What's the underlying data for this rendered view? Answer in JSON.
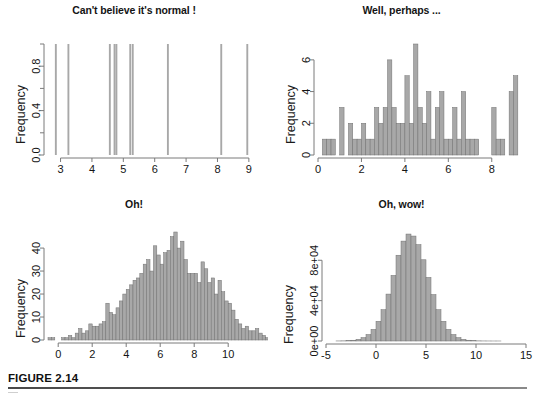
{
  "figure": {
    "caption_label": "FIGURE 2.14",
    "axis_color": "#7a7a7a",
    "bar_fill": "#a8a8a8",
    "bar_stroke": "#707070",
    "text_color": "#141414"
  },
  "panels": [
    {
      "id": "top-left",
      "title": "Can't believe it's normal !",
      "ylabel": "Frequency"
    },
    {
      "id": "top-right",
      "title": "Well, perhaps ...",
      "ylabel": "Frequency"
    },
    {
      "id": "bottom-left",
      "title": "Oh!",
      "ylabel": "Frequency"
    },
    {
      "id": "bottom-right",
      "title": "Oh, wow!",
      "ylabel": "Frequency"
    }
  ],
  "chart_data": [
    {
      "type": "bar",
      "id": "top-left",
      "title": "Can't believe it's normal !",
      "xlabel": "",
      "ylabel": "Frequency",
      "xlim": [
        2.6,
        9.1
      ],
      "ylim": [
        0,
        1
      ],
      "xticks": [
        3,
        4,
        5,
        6,
        7,
        8,
        9
      ],
      "xticklabels": [
        "3",
        "4",
        "5",
        "6",
        "7",
        "8",
        "9"
      ],
      "yticks": [
        0.0,
        0.2,
        0.4,
        0.6,
        0.8,
        1.0
      ],
      "yticklabels": [
        "0.0",
        "",
        "0.4",
        "",
        "0.8",
        ""
      ],
      "grid": false,
      "legend": null,
      "note": "Histogram of 10 observations, one unit-height bar per observation",
      "bin_width": 0.06,
      "bin_centers": [
        2.85,
        3.25,
        4.57,
        4.72,
        4.78,
        5.22,
        5.3,
        6.42,
        8.12,
        8.95
      ],
      "values": [
        1,
        1,
        1,
        1,
        1,
        1,
        1,
        1,
        1,
        1
      ]
    },
    {
      "type": "bar",
      "id": "top-right",
      "title": "Well, perhaps ...",
      "xlabel": "",
      "ylabel": "Frequency",
      "xlim": [
        0,
        9.3
      ],
      "ylim": [
        0,
        7
      ],
      "xticks": [
        0,
        2,
        4,
        6,
        8
      ],
      "xticklabels": [
        "0",
        "2",
        "4",
        "6",
        "8"
      ],
      "yticks": [
        0,
        2,
        4,
        6
      ],
      "yticklabels": [
        "0",
        "2",
        "4",
        "6"
      ],
      "grid": false,
      "legend": null,
      "note": "Histogram of 100 observations, bin width 0.2",
      "bin_width": 0.2,
      "bin_starts": [
        0.2,
        0.4,
        0.6,
        1.0,
        1.2,
        1.4,
        1.6,
        1.8,
        2.0,
        2.2,
        2.4,
        2.6,
        2.8,
        3.0,
        3.2,
        3.4,
        3.6,
        3.8,
        4.0,
        4.2,
        4.4,
        4.6,
        4.8,
        5.0,
        5.2,
        5.4,
        5.6,
        5.8,
        6.0,
        6.2,
        6.4,
        6.6,
        6.8,
        7.0,
        7.2,
        7.4,
        8.0,
        8.2,
        8.4,
        8.8,
        9.0
      ],
      "values": [
        1,
        1,
        1,
        3,
        0,
        2,
        1,
        1,
        2,
        1,
        1,
        3,
        2,
        3,
        6,
        3,
        2,
        2,
        5,
        2,
        7,
        3,
        2,
        4,
        1,
        3,
        4,
        1,
        1,
        3,
        1,
        4,
        1,
        1,
        1,
        0,
        3,
        1,
        1,
        4,
        5
      ]
    },
    {
      "type": "bar",
      "id": "bottom-left",
      "title": "Oh!",
      "xlabel": "",
      "ylabel": "Frequency",
      "xlim": [
        -0.6,
        11.4
      ],
      "ylim": [
        0,
        47
      ],
      "xticks": [
        0,
        2,
        4,
        6,
        8,
        10
      ],
      "xticklabels": [
        "0",
        "2",
        "4",
        "6",
        "8",
        "10"
      ],
      "yticks": [
        0,
        10,
        20,
        30,
        40
      ],
      "yticklabels": [
        "0",
        "10",
        "20",
        "30",
        "40"
      ],
      "grid": false,
      "legend": null,
      "note": "Histogram of 1000 observations, bin width 0.2",
      "bin_width": 0.2,
      "bin_start": -0.6,
      "values": [
        1,
        1,
        0,
        0,
        1,
        1,
        2,
        1,
        3,
        5,
        3,
        4,
        7,
        6,
        6,
        7,
        8,
        16,
        12,
        11,
        14,
        17,
        20,
        22,
        24,
        26,
        27,
        29,
        33,
        35,
        30,
        41,
        37,
        33,
        38,
        39,
        45,
        47,
        40,
        43,
        35,
        29,
        29,
        29,
        25,
        34,
        31,
        25,
        27,
        20,
        26,
        21,
        17,
        16,
        13,
        9,
        7,
        5,
        6,
        4,
        4,
        5,
        3,
        2,
        1,
        2,
        1,
        3,
        1
      ]
    },
    {
      "type": "bar",
      "id": "bottom-right",
      "title": "Oh, wow!",
      "xlabel": "",
      "ylabel": "Frequency",
      "xlim": [
        -5,
        15
      ],
      "ylim": [
        0,
        110000
      ],
      "xticks": [
        -5,
        0,
        5,
        10,
        15
      ],
      "xticklabels": [
        "-5",
        "0",
        "5",
        "10",
        "15"
      ],
      "yticks": [
        0,
        40000,
        80000
      ],
      "yticklabels": [
        "0e+00",
        "4e+04",
        "8e+04"
      ],
      "grid": false,
      "legend": null,
      "note": "Histogram of 1,000,000 observations, bin width 0.5, normal-shaped",
      "bin_width": 0.5,
      "bin_start": -4.0,
      "values": [
        60,
        140,
        330,
        760,
        1650,
        3350,
        6400,
        11500,
        19500,
        31000,
        46500,
        65000,
        85000,
        99000,
        106000,
        104000,
        95500,
        80500,
        63000,
        46000,
        31000,
        19500,
        11500,
        6400,
        3350,
        1650,
        760,
        330,
        140,
        60,
        25,
        10,
        5
      ]
    }
  ]
}
